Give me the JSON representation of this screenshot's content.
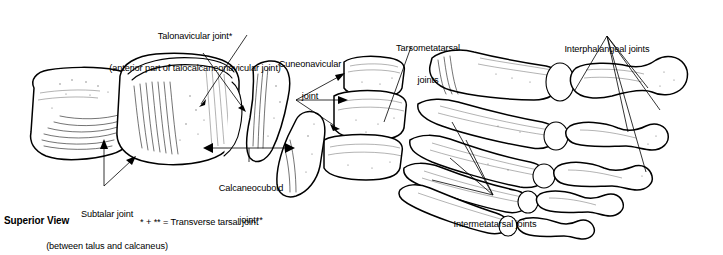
{
  "figure": {
    "view_label": "Superior View",
    "footnote": "* + ** = Transverse tarsal joint"
  },
  "labels": {
    "talonavicular": {
      "line1": "Talonavicular joint*",
      "line2": "(anterior part of talocalcaneonavicular joint)"
    },
    "cuneonavicular": {
      "line1": "Cuneonavicular",
      "line2": "joint"
    },
    "tarsometatarsal": {
      "line1": "Tarsometatarsal",
      "line2": "joints"
    },
    "interphalangeal": {
      "line1": "Interphalangeal joints"
    },
    "intermetatarsal": {
      "line1": "Intermetatarsal joints"
    },
    "calcaneocuboid": {
      "line1": "Calcaneocuboid",
      "line2": "joint**"
    },
    "subtalar": {
      "line1": "Subtalar joint",
      "line2": "(between talus and calcaneus)"
    }
  },
  "colors": {
    "ink": "#000000",
    "paper": "#ffffff"
  },
  "bones": {
    "calcaneus": "calcaneus",
    "talus": "talus",
    "navicular": "navicular",
    "cuneiform_medial": "medial-cuneiform",
    "cuneiform_intermediate": "intermediate-cuneiform",
    "cuneiform_lateral": "lateral-cuneiform",
    "cuboid": "cuboid",
    "metatarsals": [
      "metatarsal-1",
      "metatarsal-2",
      "metatarsal-3",
      "metatarsal-4",
      "metatarsal-5"
    ],
    "phalanges": [
      "phalanx-hallux",
      "phalanges-toe-2",
      "phalanges-toe-3",
      "phalanges-toe-4",
      "phalanges-toe-5"
    ]
  }
}
